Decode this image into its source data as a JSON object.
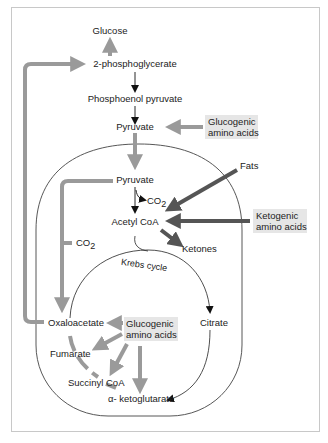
{
  "diagram": {
    "colors": {
      "frame": "#c8c8c8",
      "light_arrow": "#9a9a9a",
      "dark_arrow": "#555555",
      "thin_arrow": "#111111",
      "highlight_box": "#e6e6e6",
      "membrane": "#444444"
    },
    "nodes": {
      "glucose": "Glucose",
      "phosphoglycerate": "2-phosphoglycerate",
      "phosphoenol_pyruvate": "Phosphoenol pyruvate",
      "pyruvate_cytosol": "Pyruvate",
      "glucogenic_top_line1": "Glucogenic",
      "glucogenic_top_line2": "amino acids",
      "pyruvate_mito": "Pyruvate",
      "co2_top": "CO",
      "co2_top_sub": "2",
      "fats": "Fats",
      "acetyl_coa": "Acetyl CoA",
      "ketogenic_line1": "Ketogenic",
      "ketogenic_line2": "amino acids",
      "ketones": "Ketones",
      "co2_left": "CO",
      "co2_left_sub": "2",
      "krebs_cycle": "Krebs cycle",
      "oxaloacetate": "Oxaloacetate",
      "glucogenic_bottom_line1": "Glucogenic",
      "glucogenic_bottom_line2": "amino acids",
      "citrate": "Citrate",
      "fumarate": "Fumarate",
      "succinyl_coa": "Succinyl CoA",
      "alpha_ketoglutarate": "α- ketoglutarate"
    }
  }
}
